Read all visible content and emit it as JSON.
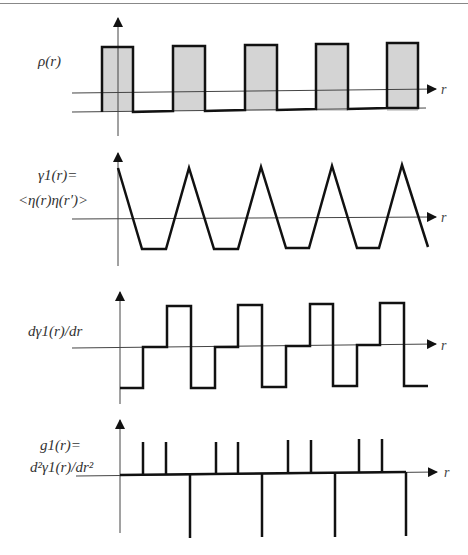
{
  "panels": [
    {
      "id": "density",
      "label_lines": [
        "ρ(r)"
      ],
      "axis_label": "r",
      "type": "square-pulses-filled",
      "fill_color": "#d4d4d4",
      "pulses": [
        [
          102,
          133
        ],
        [
          173,
          205
        ],
        [
          245,
          277
        ],
        [
          316,
          348
        ],
        [
          387,
          418
        ]
      ]
    },
    {
      "id": "correlation",
      "label_lines": [
        "γ1(r)=",
        "<η(r)η(r′)>"
      ],
      "axis_label": "r",
      "type": "triangle-wave"
    },
    {
      "id": "first-derivative",
      "label_lines": [
        "dγ1(r)/dr"
      ],
      "axis_label": "r",
      "type": "step-wave"
    },
    {
      "id": "second-derivative",
      "label_lines": [
        "g1(r)=",
        "d²γ1(r)/dr²"
      ],
      "axis_label": "r",
      "type": "delta-spikes",
      "up_spikes_x": [
        143,
        166,
        216,
        238,
        288,
        311,
        359,
        382
      ],
      "down_spikes_x": [
        190,
        262,
        335,
        406
      ]
    }
  ],
  "colors": {
    "line": "#111111",
    "axis": "#444444",
    "fill": "#d4d4d4"
  }
}
